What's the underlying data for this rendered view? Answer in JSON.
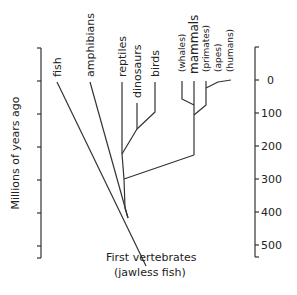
{
  "axis": {
    "label": "Millions of years ago",
    "ticks": [
      "0",
      "100",
      "200",
      "300",
      "400",
      "500"
    ]
  },
  "taxa": {
    "fish": "fish",
    "amphibians": "amphibians",
    "reptiles": "reptiles",
    "dinosaurs": "dinosaurs",
    "birds": "birds",
    "whales": "(whales)",
    "mammals": "mammals",
    "primates": "(primates)",
    "apes": "(apes)",
    "humans": "(humans)"
  },
  "root": {
    "line1": "First vertebrates",
    "line2": "(jawless fish)"
  },
  "colors": {
    "line": "#333333",
    "text": "#222222"
  }
}
